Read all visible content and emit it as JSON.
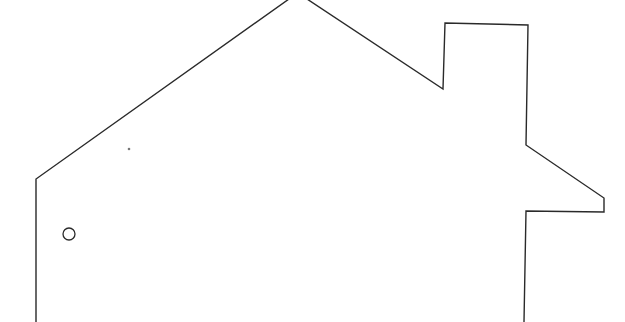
{
  "figure": {
    "description": "Line drawing outline of a house with chimney and eave",
    "colors": {
      "background": "#ffffff",
      "stroke": "#2a2a2a",
      "dot": "#777777"
    },
    "outline_points": "36,322 36,179 289,-1 307,-1 443,89 445,23 528,25 526,145 604,198 604,212 526,211 524,322",
    "circle": {
      "cx": 69,
      "cy": 234,
      "r": 6
    },
    "dot": {
      "cx": 129,
      "cy": 149,
      "r": 1.3
    }
  }
}
